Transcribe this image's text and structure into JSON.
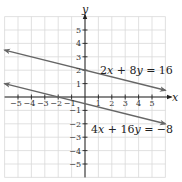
{
  "chart_data": {
    "type": "line",
    "title": "",
    "xlabel": "x",
    "ylabel": "y",
    "xlim": [
      -6,
      6
    ],
    "ylim": [
      -6,
      6
    ],
    "grid": true,
    "x_ticks": [
      -5,
      -4,
      -3,
      -2,
      -1,
      1,
      2,
      3,
      4,
      5
    ],
    "y_ticks": [
      -5,
      -4,
      -3,
      -2,
      -1,
      1,
      2,
      3,
      4,
      5
    ],
    "x_tick_labels": [
      "−5",
      "−4",
      "−3",
      "−2",
      "−1",
      "1",
      "2",
      "3",
      "4",
      "5"
    ],
    "y_tick_labels": [
      "−5",
      "−4",
      "−3",
      "−2",
      "−1",
      "1",
      "2",
      "3",
      "4",
      "5"
    ],
    "series": [
      {
        "name": "2x + 8y = 16",
        "equation": "y = 2 - x/4",
        "x": [
          -6,
          6
        ],
        "values": [
          3.5,
          0.5
        ],
        "color": "#666666",
        "arrows": "both"
      },
      {
        "name": "4x + 16y = −8",
        "equation": "y = -0.5 - x/4",
        "x": [
          -6,
          6
        ],
        "values": [
          1.0,
          -2.0
        ],
        "color": "#666666",
        "arrows": "both"
      }
    ],
    "annotations": [
      {
        "text": "2x + 8y = 16",
        "near_x": 3.2,
        "near_y": 2.5
      },
      {
        "text": "4x + 16y = −8",
        "near_x": 2.8,
        "near_y": -2.5
      }
    ]
  },
  "labels": {
    "x_axis": "x",
    "y_axis": "y",
    "eq1_a": "2",
    "eq1_x": "x",
    "eq1_mid": " + 8",
    "eq1_y": "y",
    "eq1_end": " = 16",
    "eq2_a": "4",
    "eq2_x": "x",
    "eq2_mid": " + 16",
    "eq2_y": "y",
    "eq2_end": " = −8"
  }
}
